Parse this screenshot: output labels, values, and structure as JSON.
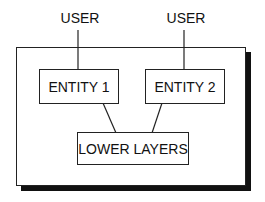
{
  "diagram": {
    "users": [
      {
        "label": "USER"
      },
      {
        "label": "USER"
      }
    ],
    "entities": [
      {
        "label": "ENTITY 1"
      },
      {
        "label": "ENTITY 2"
      }
    ],
    "lower": {
      "label": "LOWER LAYERS"
    }
  }
}
